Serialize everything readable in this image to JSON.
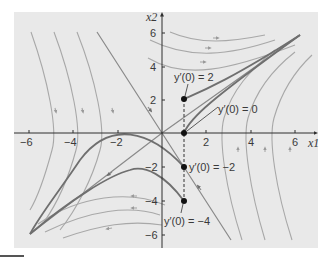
{
  "figure": {
    "title": "",
    "x_axis_label": "x1",
    "y_axis_label": "x2",
    "x_ticks": [
      {
        "value": -6,
        "label": "−6"
      },
      {
        "value": -4,
        "label": "−4"
      },
      {
        "value": -2,
        "label": "−2"
      },
      {
        "value": 2,
        "label": "2"
      },
      {
        "value": 4,
        "label": "4"
      },
      {
        "value": 6,
        "label": "6"
      }
    ],
    "y_ticks": [
      {
        "value": 6,
        "label": "6"
      },
      {
        "value": 4,
        "label": "4"
      },
      {
        "value": 2,
        "label": "2"
      },
      {
        "value": -2,
        "label": "−2"
      },
      {
        "value": -4,
        "label": "−4"
      },
      {
        "value": -6,
        "label": "−6"
      }
    ],
    "annotations": [
      {
        "text": "y′(0) = 2",
        "point": [
          1,
          2
        ]
      },
      {
        "text": "y′(0) = 0",
        "point": [
          1,
          0
        ]
      },
      {
        "text": "y′(0) = −2",
        "point": [
          1,
          -2
        ]
      },
      {
        "text": "y′(0) = −4",
        "point": [
          1,
          -4
        ]
      }
    ],
    "colors": {
      "background": "#e9e9e9",
      "trajectory": "#a8a8a8",
      "highlight": "#6f6f6f",
      "axis": "#2f2f2f",
      "point": "#111111"
    }
  }
}
